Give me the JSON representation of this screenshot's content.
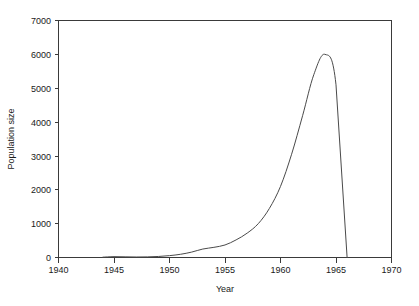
{
  "chart_data": {
    "type": "line",
    "title": "",
    "xlabel": "Year",
    "ylabel": "Population size",
    "xlim": [
      1940,
      1970
    ],
    "ylim": [
      0,
      7000
    ],
    "grid": false,
    "legend": null,
    "xticks": [
      1940,
      1945,
      1950,
      1955,
      1960,
      1965,
      1970
    ],
    "xtick_labels": [
      "1940",
      "1945",
      "1950",
      "1955",
      "1960",
      "1965",
      "1970"
    ],
    "yticks": [
      0,
      1000,
      2000,
      3000,
      4000,
      5000,
      6000,
      7000
    ],
    "ytick_labels": [
      "0",
      "1000",
      "2000",
      "3000",
      "4000",
      "5000",
      "6000",
      "7000"
    ],
    "series": [
      {
        "name": "Population size",
        "color": "#4a4a4a",
        "x": [
          1944,
          1945,
          1946,
          1947,
          1948,
          1949,
          1950,
          1951,
          1952,
          1953,
          1954,
          1955,
          1956,
          1957,
          1958,
          1959,
          1960,
          1961,
          1962,
          1963,
          1964,
          1965,
          1966
        ],
        "values": [
          10,
          25,
          20,
          15,
          18,
          30,
          55,
          95,
          160,
          250,
          300,
          370,
          520,
          720,
          1000,
          1450,
          2100,
          3050,
          4200,
          5400,
          6000,
          5100,
          0
        ]
      }
    ],
    "annotations": {
      "peak_year": 1964,
      "peak_value": 6000,
      "collapse_year": 1966,
      "collapse_value": 0
    }
  },
  "axes": {
    "x_title": "Year",
    "y_title": "Population size"
  }
}
